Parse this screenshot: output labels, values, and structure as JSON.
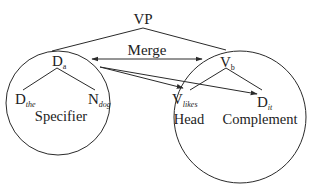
{
  "diagram": {
    "type": "syntax-tree-merge",
    "root": {
      "label": "VP"
    },
    "merge_label": "Merge",
    "specifier": {
      "role_label": "Specifier",
      "head": {
        "label": "D",
        "subscript": "a"
      },
      "children": [
        {
          "label": "D",
          "subscript": "the"
        },
        {
          "label": "N",
          "subscript": "dog"
        }
      ]
    },
    "verbal": {
      "head": {
        "label": "V",
        "subscript": "b"
      },
      "children": [
        {
          "label": "V",
          "subscript": "likes",
          "role_label": "Head"
        },
        {
          "label": "D",
          "subscript": "it",
          "role_label": "Complement"
        }
      ]
    },
    "edges": [
      {
        "from": "VP",
        "to": "D_a",
        "kind": "line"
      },
      {
        "from": "VP",
        "to": "V_b",
        "kind": "line"
      },
      {
        "from": "D_a",
        "to": "V_b",
        "kind": "double-arrow",
        "label": "Merge"
      },
      {
        "from": "D_a",
        "to": "V_likes",
        "kind": "arrow"
      },
      {
        "from": "D_a",
        "to": "D_it",
        "kind": "arrow"
      },
      {
        "from": "D_a",
        "to": "D_the",
        "kind": "line"
      },
      {
        "from": "D_a",
        "to": "N_dog",
        "kind": "line"
      },
      {
        "from": "V_b",
        "to": "V_likes",
        "kind": "line"
      },
      {
        "from": "V_b",
        "to": "D_it",
        "kind": "line"
      }
    ],
    "colors": {
      "line": "#2a2a2a",
      "text": "#222222",
      "background": "#ffffff"
    }
  }
}
